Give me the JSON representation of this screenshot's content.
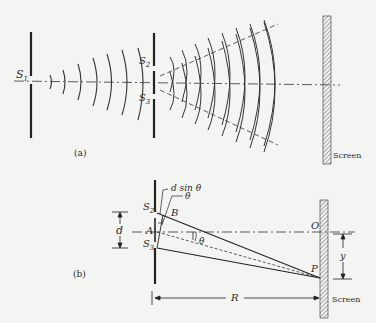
{
  "figure": {
    "panel_a": {
      "caption": "(a)",
      "labels": {
        "source": "S",
        "source_sub": "1",
        "slit_top": "S",
        "slit_top_sub": "2",
        "slit_bottom": "S",
        "slit_bottom_sub": "3",
        "screen": "Screen"
      }
    },
    "panel_b": {
      "caption": "(b)",
      "labels": {
        "path_difference": "d sin θ",
        "angle_small": "θ",
        "angle_center": "θ",
        "slit_top": "S",
        "slit_top_sub": "2",
        "slit_bottom": "S",
        "slit_bottom_sub": "3",
        "point_a": "A",
        "point_b": "B",
        "slit_separation": "d",
        "origin": "O",
        "point_p": "P",
        "offset": "y",
        "distance": "R",
        "screen": "Screen"
      }
    },
    "colors": {
      "background": "#f4f4f2",
      "ink": "#2a2a2a",
      "hatch": "#555555"
    }
  }
}
